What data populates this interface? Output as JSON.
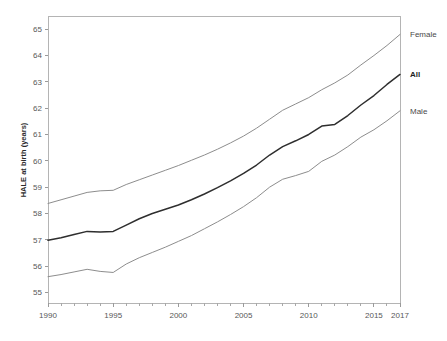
{
  "chart_data": {
    "type": "line",
    "title": "",
    "xlabel": "",
    "ylabel": "HALE at birth (years)",
    "xlim": [
      1990,
      2017
    ],
    "ylim": [
      54.6,
      65.5
    ],
    "grid": false,
    "legend_position": "right-inline",
    "x": [
      1990,
      1991,
      1992,
      1993,
      1994,
      1995,
      1996,
      1997,
      1998,
      1999,
      2000,
      2001,
      2002,
      2003,
      2004,
      2005,
      2006,
      2007,
      2008,
      2009,
      2010,
      2011,
      2012,
      2013,
      2014,
      2015,
      2016,
      2017
    ],
    "xticks": [
      1990,
      1995,
      2000,
      2005,
      2010,
      2015,
      2017
    ],
    "xtick_labels": [
      "1990",
      "1995",
      "2000",
      "2005",
      "2010",
      "2015",
      "2017"
    ],
    "yticks": [
      55,
      56,
      57,
      58,
      59,
      60,
      61,
      62,
      63,
      64,
      65
    ],
    "ytick_labels": [
      "55",
      "56",
      "57",
      "58",
      "59",
      "60",
      "61",
      "62",
      "63",
      "64",
      "65"
    ],
    "series": [
      {
        "name": "Female",
        "label": "Female",
        "emphasis": false,
        "color": "#8d8d8d",
        "values": [
          58.38,
          58.52,
          58.66,
          58.8,
          58.86,
          58.88,
          59.1,
          59.28,
          59.46,
          59.64,
          59.82,
          60.02,
          60.22,
          60.44,
          60.68,
          60.94,
          61.24,
          61.58,
          61.92,
          62.16,
          62.4,
          62.7,
          62.96,
          63.26,
          63.64,
          64.0,
          64.38,
          64.8
        ]
      },
      {
        "name": "All",
        "label": "All",
        "emphasis": true,
        "color": "#2e2e2e",
        "values": [
          56.98,
          57.08,
          57.2,
          57.32,
          57.3,
          57.32,
          57.56,
          57.8,
          58.0,
          58.16,
          58.32,
          58.52,
          58.74,
          58.98,
          59.24,
          59.52,
          59.84,
          60.22,
          60.54,
          60.76,
          61.0,
          61.32,
          61.38,
          61.72,
          62.12,
          62.48,
          62.9,
          63.28
        ]
      },
      {
        "name": "Male",
        "label": "Male",
        "emphasis": false,
        "color": "#8d8d8d",
        "values": [
          55.6,
          55.68,
          55.78,
          55.88,
          55.8,
          55.76,
          56.08,
          56.32,
          56.52,
          56.72,
          56.94,
          57.16,
          57.42,
          57.68,
          57.96,
          58.26,
          58.6,
          59.0,
          59.3,
          59.44,
          59.6,
          59.98,
          60.22,
          60.54,
          60.9,
          61.18,
          61.52,
          61.9
        ]
      }
    ],
    "series_labels": [
      {
        "text": "Female",
        "bold": false
      },
      {
        "text": "All",
        "bold": true
      },
      {
        "text": "Male",
        "bold": false
      }
    ]
  }
}
